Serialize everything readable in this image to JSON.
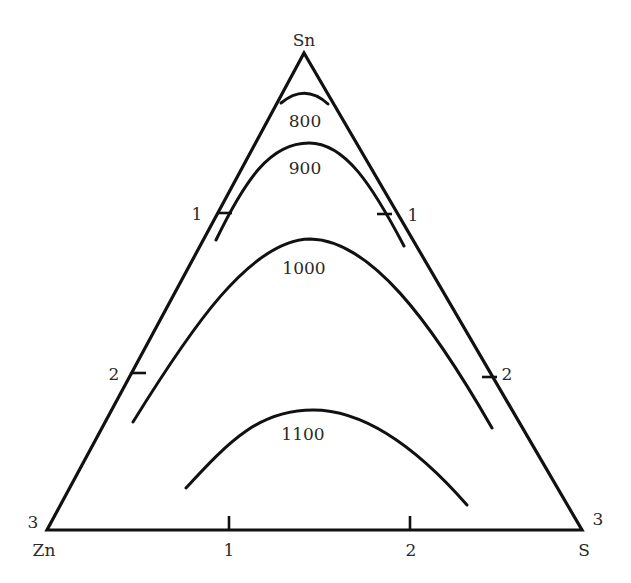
{
  "diagram": {
    "type": "ternary-isotherms",
    "vertices": {
      "top": "Sn",
      "bottom_left": "Zn",
      "bottom_right": "S"
    },
    "corner_numbers": {
      "bottom_left": "3",
      "bottom_right": "3"
    },
    "left_edge_ticks": [
      "1",
      "2"
    ],
    "right_edge_ticks": [
      "1",
      "2"
    ],
    "bottom_edge_ticks": [
      "1",
      "2"
    ],
    "isotherms": [
      {
        "label": "800"
      },
      {
        "label": "900"
      },
      {
        "label": "1000"
      },
      {
        "label": "1100"
      }
    ]
  }
}
